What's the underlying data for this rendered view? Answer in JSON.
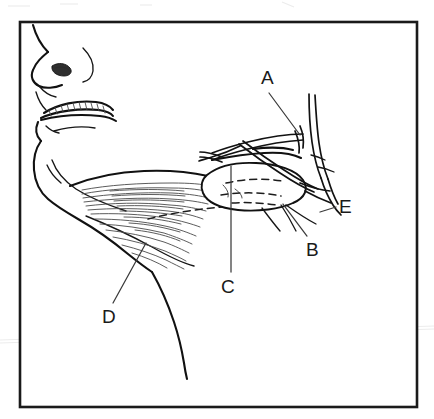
{
  "figure": {
    "kind": "anatomical-line-drawing",
    "view": "left lateral profile",
    "background_color": "#ffffff",
    "ink_color": "#111111",
    "frame": {
      "name": "figure-border",
      "color": "#1a1a1a",
      "x": 20,
      "y": 22,
      "width": 397,
      "height": 385
    }
  },
  "labels": [
    {
      "id": "A",
      "text": "A",
      "x": 261,
      "y": 68,
      "leader_from": [
        269,
        93
      ],
      "leader_to": [
        300,
        135
      ],
      "points_to": "upper vessel trunk near ramus of mandible"
    },
    {
      "id": "B",
      "text": "B",
      "x": 306,
      "y": 240,
      "leader_from": [
        307,
        236
      ],
      "leader_to": [
        283,
        204
      ],
      "points_to": "gland lower border / vessel branch"
    },
    {
      "id": "C",
      "text": "C",
      "x": 221,
      "y": 277,
      "leader_from": [
        231,
        272
      ],
      "leader_to": [
        231,
        166
      ],
      "points_to": "structure within submandibular gland"
    },
    {
      "id": "D",
      "text": "D",
      "x": 102,
      "y": 307,
      "leader_from": [
        113,
        303
      ],
      "leader_to": [
        146,
        243
      ],
      "points_to": "striated muscle belly"
    },
    {
      "id": "E",
      "text": "E",
      "x": 339,
      "y": 197,
      "leader_from": [
        336,
        207
      ],
      "leader_to": [
        322,
        212
      ],
      "points_to": "descending vessel in neck"
    }
  ],
  "structures": [
    {
      "name": "nose-profile",
      "region": "upper left"
    },
    {
      "name": "nostril",
      "region": "upper left"
    },
    {
      "name": "upper-lip",
      "region": "left"
    },
    {
      "name": "lower-lip",
      "region": "left"
    },
    {
      "name": "chin",
      "region": "left"
    },
    {
      "name": "mandible-border",
      "region": "center left"
    },
    {
      "name": "striated-muscle",
      "region": "center"
    },
    {
      "name": "submandibular-gland",
      "region": "center right"
    },
    {
      "name": "vessel-network",
      "region": "right"
    },
    {
      "name": "neck-contour",
      "region": "lower center"
    }
  ]
}
